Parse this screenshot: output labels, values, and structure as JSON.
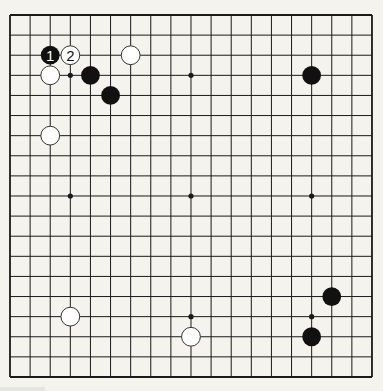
{
  "board": {
    "size": 19,
    "origin_x": 10,
    "origin_y": 15,
    "spacing": 20.11,
    "line_color": "#1a1a1a",
    "background": "#f4f3ee",
    "star_points": [
      [
        3,
        3
      ],
      [
        9,
        3
      ],
      [
        15,
        3
      ],
      [
        3,
        9
      ],
      [
        9,
        9
      ],
      [
        15,
        9
      ],
      [
        3,
        15
      ],
      [
        9,
        15
      ],
      [
        15,
        15
      ]
    ]
  },
  "stones": [
    {
      "color": "black",
      "col": 2,
      "row": 2,
      "label": "1"
    },
    {
      "color": "white",
      "col": 3,
      "row": 2,
      "label": "2"
    },
    {
      "color": "white",
      "col": 6,
      "row": 2,
      "label": ""
    },
    {
      "color": "white",
      "col": 2,
      "row": 3,
      "label": ""
    },
    {
      "color": "black",
      "col": 4,
      "row": 3,
      "label": ""
    },
    {
      "color": "black",
      "col": 5,
      "row": 4,
      "label": ""
    },
    {
      "color": "black",
      "col": 15,
      "row": 3,
      "label": ""
    },
    {
      "color": "white",
      "col": 2,
      "row": 6,
      "label": ""
    },
    {
      "color": "black",
      "col": 16,
      "row": 14,
      "label": ""
    },
    {
      "color": "white",
      "col": 3,
      "row": 15,
      "label": ""
    },
    {
      "color": "white",
      "col": 9,
      "row": 16,
      "label": ""
    },
    {
      "color": "black",
      "col": 15,
      "row": 16,
      "label": ""
    }
  ],
  "colors": {
    "black_stone": "#111111",
    "white_stone": "#ffffff",
    "white_stone_edge": "#333333"
  }
}
